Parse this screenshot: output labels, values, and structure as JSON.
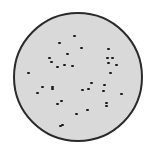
{
  "caption": "",
  "dish": {
    "fill_color": "#d9d9d9",
    "border_color": "#2a2a2a",
    "center": [
      77,
      77
    ],
    "radius": 64
  },
  "dots": [
    [
      74,
      36
    ],
    [
      59,
      43
    ],
    [
      81,
      48
    ],
    [
      67,
      54
    ],
    [
      108,
      49
    ],
    [
      49,
      58
    ],
    [
      51,
      62
    ],
    [
      107,
      58
    ],
    [
      112,
      58
    ],
    [
      108,
      63
    ],
    [
      116,
      65
    ],
    [
      57,
      67
    ],
    [
      64,
      65
    ],
    [
      72,
      66
    ],
    [
      28,
      73
    ],
    [
      110,
      73
    ],
    [
      91,
      83
    ],
    [
      104,
      85
    ],
    [
      42,
      87
    ],
    [
      52,
      87
    ],
    [
      52,
      89
    ],
    [
      37,
      93
    ],
    [
      82,
      90
    ],
    [
      88,
      89
    ],
    [
      103,
      91
    ],
    [
      121,
      94
    ],
    [
      61,
      101
    ],
    [
      57,
      104
    ],
    [
      106,
      103
    ],
    [
      106,
      106
    ],
    [
      76,
      114
    ],
    [
      87,
      110
    ],
    [
      60,
      126
    ],
    [
      62,
      125
    ]
  ],
  "dot_color": "#1a1a1a"
}
